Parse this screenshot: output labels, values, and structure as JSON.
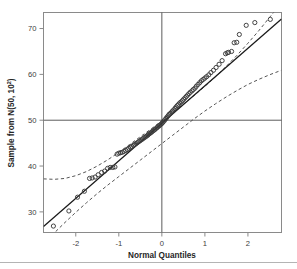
{
  "figure": {
    "background": "#ffffff",
    "frame_color": "#8a8a8a",
    "point_color": "#3a3a3a",
    "line_color": "#1a1a1a",
    "band_color": "#555555",
    "ref_line_color": "#4a4a4a",
    "footer_rule_color": "#b4b4b4"
  },
  "chart_data": {
    "type": "scatter",
    "title": "",
    "subtitle": "",
    "xlabel": "Normal Quantiles",
    "ylabel": "Sample from N(50, 10²)",
    "ylabel_base": "Sample from N(50, 10",
    "ylabel_sup": "2",
    "ylabel_tail": ")",
    "xlim": [
      -2.75,
      2.78
    ],
    "ylim": [
      25.5,
      73.5
    ],
    "xticks": [
      -2,
      -1,
      0,
      1,
      2
    ],
    "xticklabels": [
      "-2",
      "-1",
      "0",
      "1",
      "2"
    ],
    "yticks": [
      30,
      40,
      50,
      60,
      70
    ],
    "yticklabels": [
      "30",
      "40",
      "50",
      "60",
      "70"
    ],
    "grid": false,
    "legend": null,
    "annotations": [
      {
        "name": "reference-crosshair-vertical",
        "x": 0
      },
      {
        "name": "reference-crosshair-horizontal",
        "y": 50
      }
    ],
    "series": [
      {
        "name": "qq-reference-line",
        "type": "line",
        "style": "solid",
        "points": [
          [
            -2.75,
            26.8
          ],
          [
            2.78,
            72.1
          ]
        ]
      },
      {
        "name": "upper-confidence-band",
        "type": "line",
        "style": "dashed",
        "points": [
          [
            -2.75,
            37.2
          ],
          [
            -2.5,
            37.1
          ],
          [
            -2.25,
            37.3
          ],
          [
            -2.0,
            37.9
          ],
          [
            -1.75,
            38.8
          ],
          [
            -1.5,
            40.0
          ],
          [
            -1.25,
            41.4
          ],
          [
            -1.0,
            43.0
          ],
          [
            -0.75,
            44.7
          ],
          [
            -0.5,
            46.4
          ],
          [
            -0.25,
            48.1
          ],
          [
            0.0,
            49.9
          ],
          [
            0.25,
            51.7
          ],
          [
            0.5,
            53.5
          ],
          [
            0.75,
            55.4
          ],
          [
            1.0,
            57.4
          ],
          [
            1.25,
            59.5
          ],
          [
            1.5,
            61.8
          ],
          [
            1.75,
            64.2
          ],
          [
            2.0,
            66.8
          ],
          [
            2.25,
            69.5
          ],
          [
            2.5,
            72.4
          ],
          [
            2.78,
            75.6
          ]
        ]
      },
      {
        "name": "lower-confidence-band",
        "type": "line",
        "style": "dashed",
        "points": [
          [
            -2.75,
            23.0
          ],
          [
            -2.5,
            25.4
          ],
          [
            -2.25,
            27.7
          ],
          [
            -2.0,
            29.9
          ],
          [
            -1.75,
            32.0
          ],
          [
            -1.5,
            34.0
          ],
          [
            -1.25,
            35.9
          ],
          [
            -1.0,
            37.7
          ],
          [
            -0.75,
            39.5
          ],
          [
            -0.5,
            41.3
          ],
          [
            -0.25,
            43.1
          ],
          [
            0.0,
            44.9
          ],
          [
            0.25,
            46.7
          ],
          [
            0.5,
            48.5
          ],
          [
            0.75,
            50.3
          ],
          [
            1.0,
            52.0
          ],
          [
            1.25,
            53.6
          ],
          [
            1.5,
            55.1
          ],
          [
            1.75,
            56.5
          ],
          [
            2.0,
            57.8
          ],
          [
            2.25,
            58.9
          ],
          [
            2.5,
            59.9
          ],
          [
            2.78,
            60.9
          ]
        ]
      },
      {
        "name": "sample-quantile-points",
        "type": "scatter",
        "marker": "open-circle",
        "points": [
          [
            -2.52,
            26.9
          ],
          [
            -2.16,
            30.2
          ],
          [
            -1.96,
            33.2
          ],
          [
            -1.8,
            34.5
          ],
          [
            -1.68,
            37.3
          ],
          [
            -1.62,
            37.4
          ],
          [
            -1.55,
            37.6
          ],
          [
            -1.48,
            38.1
          ],
          [
            -1.4,
            38.6
          ],
          [
            -1.33,
            38.9
          ],
          [
            -1.26,
            39.5
          ],
          [
            -1.2,
            39.7
          ],
          [
            -1.14,
            39.7
          ],
          [
            -1.09,
            39.8
          ],
          [
            -1.04,
            42.6
          ],
          [
            -1.0,
            42.8
          ],
          [
            -0.96,
            42.9
          ],
          [
            -0.92,
            43.0
          ],
          [
            -0.88,
            43.2
          ],
          [
            -0.84,
            43.4
          ],
          [
            -0.8,
            43.6
          ],
          [
            -0.77,
            43.9
          ],
          [
            -0.73,
            44.1
          ],
          [
            -0.7,
            44.3
          ],
          [
            -0.66,
            44.5
          ],
          [
            -0.63,
            44.7
          ],
          [
            -0.6,
            44.9
          ],
          [
            -0.57,
            45.1
          ],
          [
            -0.54,
            45.3
          ],
          [
            -0.51,
            45.5
          ],
          [
            -0.48,
            45.7
          ],
          [
            -0.45,
            45.9
          ],
          [
            -0.42,
            46.1
          ],
          [
            -0.39,
            46.3
          ],
          [
            -0.36,
            46.5
          ],
          [
            -0.33,
            46.7
          ],
          [
            -0.31,
            46.9
          ],
          [
            -0.28,
            47.1
          ],
          [
            -0.25,
            47.3
          ],
          [
            -0.23,
            47.5
          ],
          [
            -0.2,
            47.7
          ],
          [
            -0.17,
            47.9
          ],
          [
            -0.15,
            48.1
          ],
          [
            -0.12,
            48.3
          ],
          [
            -0.1,
            48.5
          ],
          [
            -0.07,
            48.7
          ],
          [
            -0.05,
            48.9
          ],
          [
            -0.02,
            49.1
          ],
          [
            0.0,
            49.3
          ],
          [
            0.02,
            49.5
          ],
          [
            0.05,
            49.8
          ],
          [
            0.07,
            50.1
          ],
          [
            0.1,
            50.4
          ],
          [
            0.12,
            50.7
          ],
          [
            0.15,
            51.0
          ],
          [
            0.17,
            51.3
          ],
          [
            0.2,
            51.5
          ],
          [
            0.23,
            51.8
          ],
          [
            0.25,
            52.0
          ],
          [
            0.28,
            52.3
          ],
          [
            0.31,
            52.6
          ],
          [
            0.33,
            52.9
          ],
          [
            0.36,
            53.2
          ],
          [
            0.39,
            53.5
          ],
          [
            0.42,
            53.8
          ],
          [
            0.45,
            54.0
          ],
          [
            0.48,
            54.3
          ],
          [
            0.51,
            54.6
          ],
          [
            0.54,
            54.9
          ],
          [
            0.57,
            55.2
          ],
          [
            0.6,
            55.5
          ],
          [
            0.63,
            55.8
          ],
          [
            0.66,
            56.1
          ],
          [
            0.7,
            56.4
          ],
          [
            0.73,
            56.7
          ],
          [
            0.77,
            57.0
          ],
          [
            0.8,
            57.4
          ],
          [
            0.84,
            57.8
          ],
          [
            0.88,
            58.2
          ],
          [
            0.92,
            58.6
          ],
          [
            0.96,
            58.9
          ],
          [
            1.0,
            59.2
          ],
          [
            1.04,
            59.5
          ],
          [
            1.09,
            59.9
          ],
          [
            1.14,
            60.4
          ],
          [
            1.2,
            60.9
          ],
          [
            1.26,
            61.5
          ],
          [
            1.33,
            62.2
          ],
          [
            1.4,
            63.0
          ],
          [
            1.48,
            64.5
          ],
          [
            1.52,
            64.7
          ],
          [
            1.55,
            64.8
          ],
          [
            1.62,
            65.0
          ],
          [
            1.68,
            66.9
          ],
          [
            1.74,
            67.0
          ],
          [
            1.8,
            68.7
          ],
          [
            1.96,
            70.7
          ],
          [
            2.16,
            71.3
          ],
          [
            2.52,
            72.0
          ]
        ]
      }
    ]
  }
}
